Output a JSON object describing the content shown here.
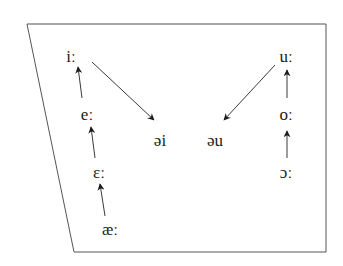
{
  "diagram": {
    "type": "vowel-chart",
    "stroke_color": "#3a3a3a",
    "text_color": "#1a1a1a",
    "frame": {
      "shape": "trapezoid"
    },
    "vowels": [
      {
        "id": "i",
        "label": "iː",
        "x": 71,
        "y": 56
      },
      {
        "id": "e",
        "label": "eː",
        "x": 87,
        "y": 114
      },
      {
        "id": "eps",
        "label": "ɛː",
        "x": 99,
        "y": 172
      },
      {
        "id": "ae",
        "label": "æː",
        "x": 110,
        "y": 229
      },
      {
        "id": "u",
        "label": "uː",
        "x": 286,
        "y": 56
      },
      {
        "id": "o",
        "label": "oː",
        "x": 286,
        "y": 114
      },
      {
        "id": "open-o",
        "label": "ɔː",
        "x": 286,
        "y": 172
      },
      {
        "id": "schwa-i",
        "label": "əi",
        "x": 160,
        "y": 140
      },
      {
        "id": "schwa-u",
        "label": "əu",
        "x": 215,
        "y": 140
      }
    ],
    "arrows": [
      {
        "from": "ae",
        "to": "eps"
      },
      {
        "from": "eps",
        "to": "e"
      },
      {
        "from": "e",
        "to": "i"
      },
      {
        "from": "i",
        "to": "schwa-i"
      },
      {
        "from": "open-o",
        "to": "o"
      },
      {
        "from": "o",
        "to": "u"
      },
      {
        "from": "u",
        "to": "schwa-u"
      }
    ]
  }
}
